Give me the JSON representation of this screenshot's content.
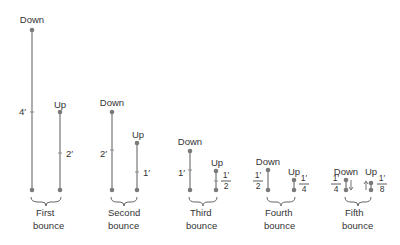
{
  "diagram": {
    "baseline_y": 190,
    "colors": {
      "line": "#8a8a8a",
      "dot": "#7a7a7a",
      "text": "#333333",
      "brace": "#666666"
    },
    "bounces": [
      {
        "name": "first",
        "caption_line1": "First",
        "caption_line2": "bounce",
        "down": {
          "label": "Down",
          "x": 32,
          "top": 30,
          "height_label": "4′",
          "fraction": false
        },
        "up": {
          "label": "Up",
          "x": 60,
          "top": 112,
          "height_label": "2′",
          "fraction": false
        }
      },
      {
        "name": "second",
        "caption_line1": "Second",
        "caption_line2": "bounce",
        "down": {
          "label": "Down",
          "x": 112,
          "top": 112,
          "height_label": "2′",
          "fraction": false
        },
        "up": {
          "label": "Up",
          "x": 137,
          "top": 143,
          "height_label": "1′",
          "fraction": false
        }
      },
      {
        "name": "third",
        "caption_line1": "Third",
        "caption_line2": "bounce",
        "down": {
          "label": "Down",
          "x": 190,
          "top": 151,
          "height_label": "1′",
          "fraction": false
        },
        "up": {
          "label": "Up",
          "x": 216,
          "top": 171,
          "height_num": "1′",
          "height_den": "2",
          "fraction": true
        }
      },
      {
        "name": "fourth",
        "caption_line1": "Fourth",
        "caption_line2": "bounce",
        "down": {
          "label": "Down",
          "x": 268,
          "top": 170,
          "height_num": "1′",
          "height_den": "2",
          "fraction": true
        },
        "up": {
          "label": "Up",
          "x": 294,
          "top": 180,
          "height_num": "1′",
          "height_den": "4",
          "fraction": true
        }
      },
      {
        "name": "fifth",
        "caption_line1": "Fifth",
        "caption_line2": "bounce",
        "down": {
          "label": "Down",
          "x": 346,
          "top": 180,
          "height_num": "1′",
          "height_den": "4",
          "fraction": true
        },
        "up": {
          "label": "Up",
          "x": 370,
          "top": 185,
          "height_num": "1′",
          "height_den": "8",
          "fraction": true
        }
      }
    ]
  }
}
